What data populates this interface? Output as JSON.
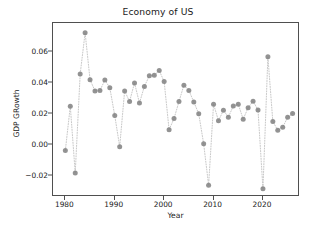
{
  "chart_data": {
    "type": "scatter",
    "title": "Economy of US",
    "xlabel": "Year",
    "ylabel": "GDP GRowth",
    "grid": false,
    "legend": null,
    "marker": "circle",
    "marker_color": "#808080",
    "line_style": "dotted",
    "line_color": "#c8c8c8",
    "xlim": [
      1977.5,
      2027.5
    ],
    "ylim": [
      -0.0335,
      0.0785
    ],
    "xticks": [
      1980,
      1990,
      2000,
      2010,
      2020
    ],
    "xtick_labels": [
      "1980",
      "1990",
      "2000",
      "2010",
      "2020"
    ],
    "yticks": [
      -0.02,
      0.0,
      0.02,
      0.04,
      0.06
    ],
    "ytick_labels": [
      "−0.02",
      "0.00",
      "0.02",
      "0.04",
      "0.06"
    ],
    "x": [
      1980,
      1981,
      1982,
      1983,
      1984,
      1985,
      1986,
      1987,
      1988,
      1989,
      1990,
      1991,
      1992,
      1993,
      1994,
      1995,
      1996,
      1997,
      1998,
      1999,
      2000,
      2001,
      2002,
      2003,
      2004,
      2005,
      2006,
      2007,
      2008,
      2009,
      2010,
      2011,
      2012,
      2013,
      2014,
      2015,
      2016,
      2017,
      2018,
      2019,
      2020,
      2021,
      2022,
      2023,
      2024,
      2025,
      2026
    ],
    "y": [
      -0.0035,
      0.0249,
      -0.018,
      0.0456,
      0.0722,
      0.042,
      0.0348,
      0.035,
      0.0418,
      0.0368,
      0.0189,
      -0.0011,
      0.0348,
      0.028,
      0.0399,
      0.027,
      0.0377,
      0.0445,
      0.0448,
      0.0479,
      0.0408,
      0.0098,
      0.017,
      0.0279,
      0.0385,
      0.0351,
      0.0277,
      0.0201,
      0.0007,
      -0.0259,
      0.0262,
      0.0156,
      0.0223,
      0.0179,
      0.0251,
      0.0262,
      0.0166,
      0.024,
      0.0282,
      0.0225,
      -0.0282,
      0.0568,
      0.0151,
      0.0095,
      0.0114,
      0.0178,
      0.0202
    ],
    "series_label": "GDP Growth",
    "n_points": 47
  }
}
